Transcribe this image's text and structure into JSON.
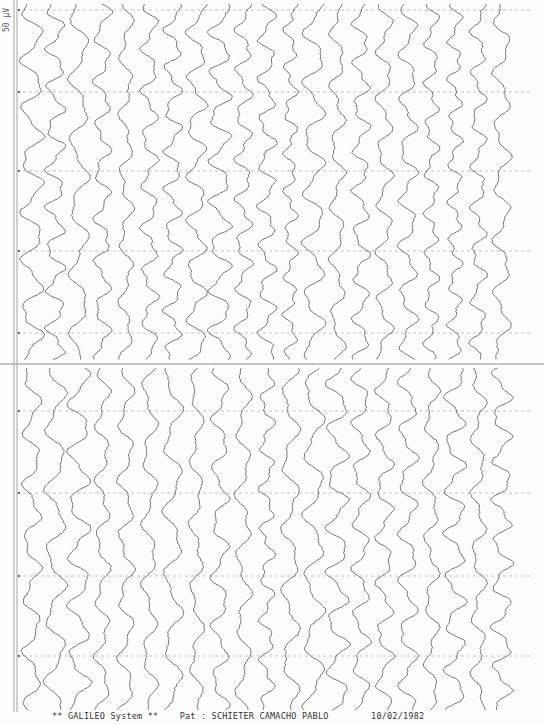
{
  "document": {
    "type": "EEG paper printout (scanned)",
    "scale_label": "50 μV",
    "footer": {
      "system": "** GALILEO System **",
      "patient_label": "Pat :",
      "patient_name": "SCHIETER CAMACHO PABLO",
      "date": "10/02/1982"
    }
  },
  "layout": {
    "axis_x": [
      14,
      17
    ],
    "divider_y": 364,
    "top_block": {
      "y_start": 4,
      "y_end": 360
    },
    "bottom_block": {
      "y_start": 368,
      "y_end": 710
    },
    "time_markers_y": [
      10,
      92,
      171,
      251,
      333,
      411,
      493,
      576,
      656
    ],
    "channel_count": 21,
    "channel_x_start": 32,
    "channel_spacing": 23.5,
    "trace_color": "#4a4a4a",
    "marker_color": "#9a9a9a",
    "axis_color": "#8a8a8a"
  }
}
